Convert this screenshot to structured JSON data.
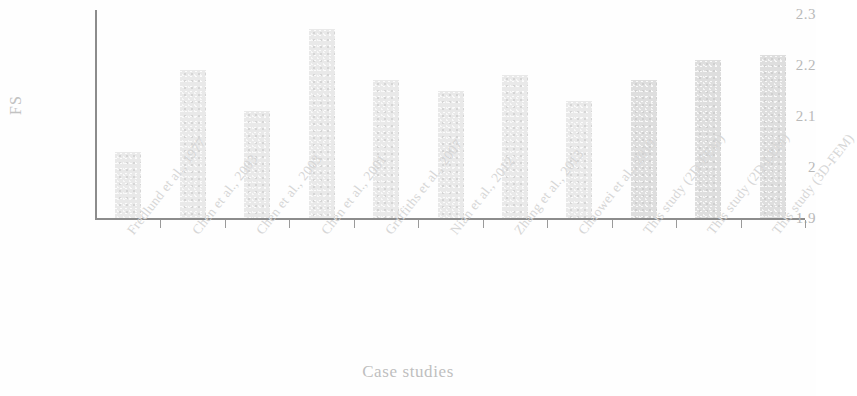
{
  "chart_data": {
    "type": "bar",
    "title": "",
    "xlabel": "Case studies",
    "ylabel": "FS",
    "ylim": [
      1.9,
      2.3
    ],
    "ytick_labels": [
      "2.3",
      "2.2",
      "2.1",
      "2",
      "1.9"
    ],
    "ytick_values": [
      2.3,
      2.2,
      2.1,
      2.0,
      1.9
    ],
    "grid": false,
    "legend": "none",
    "categories": [
      "Fredlund et al., 1977",
      "Chen et al., 2003",
      "Chen et al., 2003",
      "Chen et al., 2001",
      "Griffiths et al., 2007",
      "Nian et al., 2012",
      "Zhang et al., 2013",
      "Chaowei et al., 2019",
      "This study (2D-FEM)",
      "This study (2D-LEM)",
      "This study (3D-FEM)"
    ],
    "values": [
      2.03,
      2.19,
      2.11,
      2.27,
      2.17,
      2.15,
      2.18,
      2.13,
      2.17,
      2.21,
      2.22
    ],
    "bar_colors": [
      "#e9e9e9",
      "#e9e9e9",
      "#e9e9e9",
      "#e9e9e9",
      "#e9e9e9",
      "#e9e9e9",
      "#e9e9e9",
      "#e9e9e9",
      "#dedede",
      "#dedede",
      "#dedede"
    ]
  },
  "axes": {
    "y_title": "FS",
    "x_title": "Case studies"
  }
}
